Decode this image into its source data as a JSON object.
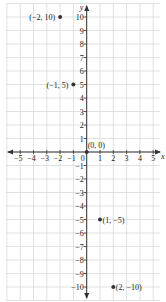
{
  "chart_data": {
    "type": "scatter",
    "title": "",
    "xlabel": "x",
    "ylabel": "y",
    "xlim": [
      -5.5,
      5.5
    ],
    "ylim": [
      -10.5,
      10.5
    ],
    "grid": true,
    "legend": null,
    "x_ticks": [
      -5,
      -4,
      -3,
      -2,
      -1,
      1,
      2,
      3,
      4,
      5
    ],
    "y_ticks": [
      10,
      9,
      8,
      7,
      6,
      5,
      4,
      3,
      2,
      1,
      -1,
      -2,
      -3,
      -4,
      -5,
      -6,
      -7,
      -8,
      -9,
      -10
    ],
    "origin_label": "0",
    "points": [
      {
        "x": -2,
        "y": 10,
        "label": "(−2, 10)",
        "label_side": "left"
      },
      {
        "x": -1,
        "y": 5,
        "label": "(−1, 5)",
        "label_side": "left"
      },
      {
        "x": 0,
        "y": 0,
        "label": "(0, 0)",
        "label_side": "above-right"
      },
      {
        "x": 1,
        "y": -5,
        "label": "(1, −5)",
        "label_side": "right"
      },
      {
        "x": 2,
        "y": -10,
        "label": "(2, −10)",
        "label_side": "right"
      }
    ],
    "colors": {
      "grid": "#d4d4d4",
      "axis": "#333333",
      "point": "#333333",
      "text": "#222222"
    }
  }
}
